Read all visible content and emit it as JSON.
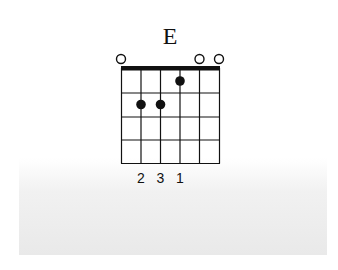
{
  "chord": {
    "name": "E",
    "strings": 6,
    "frets_shown": 4,
    "open_strings": [
      1,
      5,
      6
    ],
    "muted_strings": [],
    "dots": [
      {
        "string": 2,
        "fret": 2,
        "finger": 2
      },
      {
        "string": 3,
        "fret": 2,
        "finger": 3
      },
      {
        "string": 4,
        "fret": 1,
        "finger": 1
      }
    ],
    "finger_labels": [
      "2",
      "3",
      "1"
    ]
  },
  "colors": {
    "line": "#111111",
    "dot": "#111111",
    "background": "#ffffff",
    "panel": "#ececec"
  }
}
